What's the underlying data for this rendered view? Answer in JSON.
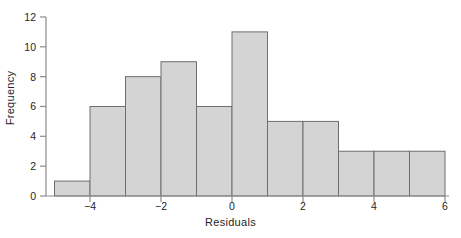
{
  "chart_data": {
    "type": "bar",
    "title": "",
    "subtitle": "",
    "xlabel": "Residuals",
    "ylabel": "Frequency",
    "xlim": [
      -5.6,
      6.4
    ],
    "ylim": [
      0,
      12
    ],
    "grid": false,
    "legend": null,
    "bin_width": 1,
    "bin_edges": [
      -5,
      -4,
      -3,
      -2,
      -1,
      0,
      1,
      2,
      3,
      4,
      5,
      6
    ],
    "categories": [
      "-5 to -4",
      "-4 to -3",
      "-3 to -2",
      "-2 to -1",
      "-1 to 0",
      "0 to 1",
      "1 to 2",
      "2 to 3",
      "3 to 4",
      "4 to 5",
      "5 to 6"
    ],
    "values": [
      1,
      6,
      8,
      9,
      6,
      11,
      5,
      5,
      3,
      3,
      3
    ],
    "xticks": [
      -4,
      -2,
      0,
      2,
      4,
      6
    ],
    "xtick_labels": [
      "−4",
      "−2",
      "0",
      "2",
      "4",
      "6"
    ],
    "yticks": [
      0,
      2,
      4,
      6,
      8,
      10,
      12
    ],
    "ytick_labels": [
      "0",
      "2",
      "4",
      "6",
      "8",
      "10",
      "12"
    ],
    "bar_fill_color": "#d4d4d4",
    "bar_edge_color": "#6e6e6e",
    "axis_color": "#8c8c8c",
    "text_color": "#262626",
    "background_color": "#ffffff"
  }
}
